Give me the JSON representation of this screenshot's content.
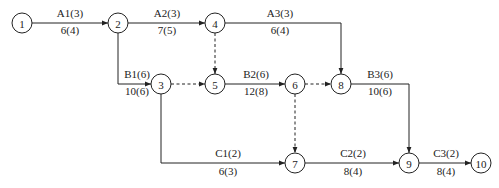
{
  "diagram": {
    "type": "activity-on-arrow network",
    "nodes": [
      {
        "id": "1",
        "label": "1"
      },
      {
        "id": "2",
        "label": "2"
      },
      {
        "id": "3",
        "label": "3"
      },
      {
        "id": "4",
        "label": "4"
      },
      {
        "id": "5",
        "label": "5"
      },
      {
        "id": "6",
        "label": "6"
      },
      {
        "id": "7",
        "label": "7"
      },
      {
        "id": "8",
        "label": "8"
      },
      {
        "id": "9",
        "label": "9"
      },
      {
        "id": "10",
        "label": "10"
      }
    ],
    "edges": [
      {
        "id": "A1",
        "from": "1",
        "to": "2",
        "dummy": false,
        "top": "A1(3)",
        "bottom": "6(4)"
      },
      {
        "id": "A2",
        "from": "2",
        "to": "4",
        "dummy": false,
        "top": "A2(3)",
        "bottom": "7(5)"
      },
      {
        "id": "A3",
        "from": "4",
        "to": "8",
        "dummy": false,
        "top": "A3(3)",
        "bottom": "6(4)"
      },
      {
        "id": "B1",
        "from": "2",
        "to": "3",
        "dummy": false,
        "top": "B1(6)",
        "bottom": "10(6)"
      },
      {
        "id": "B2",
        "from": "5",
        "to": "6",
        "dummy": false,
        "top": "B2(6)",
        "bottom": "12(8)"
      },
      {
        "id": "B3",
        "from": "8",
        "to": "9",
        "dummy": false,
        "top": "B3(6)",
        "bottom": "10(6)"
      },
      {
        "id": "C1",
        "from": "3",
        "to": "7",
        "dummy": false,
        "top": "C1(2)",
        "bottom": "6(3)"
      },
      {
        "id": "C2",
        "from": "7",
        "to": "9",
        "dummy": false,
        "top": "C2(2)",
        "bottom": "8(4)"
      },
      {
        "id": "C3",
        "from": "9",
        "to": "10",
        "dummy": false,
        "top": "C3(2)",
        "bottom": "8(4)"
      },
      {
        "id": "d-4-5",
        "from": "4",
        "to": "5",
        "dummy": true,
        "top": "",
        "bottom": ""
      },
      {
        "id": "d-3-5",
        "from": "3",
        "to": "5",
        "dummy": true,
        "top": "",
        "bottom": ""
      },
      {
        "id": "d-6-8",
        "from": "6",
        "to": "8",
        "dummy": true,
        "top": "",
        "bottom": ""
      },
      {
        "id": "d-6-7",
        "from": "6",
        "to": "7",
        "dummy": true,
        "top": "",
        "bottom": ""
      }
    ]
  }
}
